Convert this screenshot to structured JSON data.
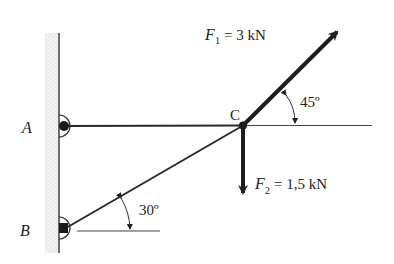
{
  "diagram": {
    "type": "statics-truss",
    "points": {
      "A": {
        "label": "A"
      },
      "B": {
        "label": "B"
      },
      "C": {
        "label": "C"
      }
    },
    "forces": [
      {
        "name": "F1",
        "symbol": "F",
        "subscript": "1",
        "value_text": "= 3 kN",
        "direction_deg": 45
      },
      {
        "name": "F2",
        "symbol": "F",
        "subscript": "2",
        "value_text": "= 1,5 kN",
        "direction": "down"
      }
    ],
    "angles": [
      {
        "label": "45º",
        "between": "F1 and horizontal"
      },
      {
        "label": "30º",
        "between": "BC and horizontal"
      }
    ],
    "colors": {
      "ink": "#222222",
      "wall_hatch": "#cfcfcf"
    }
  }
}
